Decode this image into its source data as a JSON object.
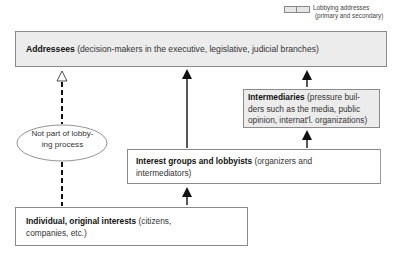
{
  "legend": {
    "line1": "Lobbying addresses",
    "line2": "(primary and secondary)",
    "swatch_color": "#e6e6e6"
  },
  "nodes": {
    "addressees": {
      "title": "Addressees",
      "description": "(decision-makers in the executive, legislative, judicial branches)",
      "fill": "#ececec"
    },
    "intermediaries": {
      "title": "Intermediaries",
      "description": "(pressure builders such as the media, public opinion, internat'l. organizations)",
      "line1_title": "Intermediaries",
      "line1_rest": " (pressure buil-",
      "line2": "ders such as the media, public",
      "line3": "opinion, internat'l. organizations)",
      "fill": "#ececec"
    },
    "interest_groups": {
      "title": "Interest groups and lobbyists",
      "description": "(organizers and intermediators)",
      "line1_rest": " (organizers and",
      "line2": "intermediators)",
      "fill": "#ffffff"
    },
    "individual": {
      "title": "Individual, original interests",
      "description": "(citizens, companies, etc.)",
      "line1_rest": " (citizens,",
      "line2": "companies, etc.)",
      "fill": "#ffffff"
    },
    "not_part": {
      "line1": "Not part of lobby-",
      "line2": "ing process",
      "shape": "ellipse"
    }
  },
  "edges": [
    {
      "from": "individual",
      "to": "addressees",
      "style": "dashed",
      "head": "open",
      "label": "Not part of lobbying process"
    },
    {
      "from": "interest_groups",
      "to": "addressees",
      "style": "solid",
      "head": "filled"
    },
    {
      "from": "interest_groups",
      "to": "intermediaries",
      "style": "solid",
      "head": "filled"
    },
    {
      "from": "intermediaries",
      "to": "addressees",
      "style": "solid",
      "head": "filled"
    },
    {
      "from": "individual",
      "to": "interest_groups",
      "style": "solid",
      "head": "filled"
    }
  ]
}
